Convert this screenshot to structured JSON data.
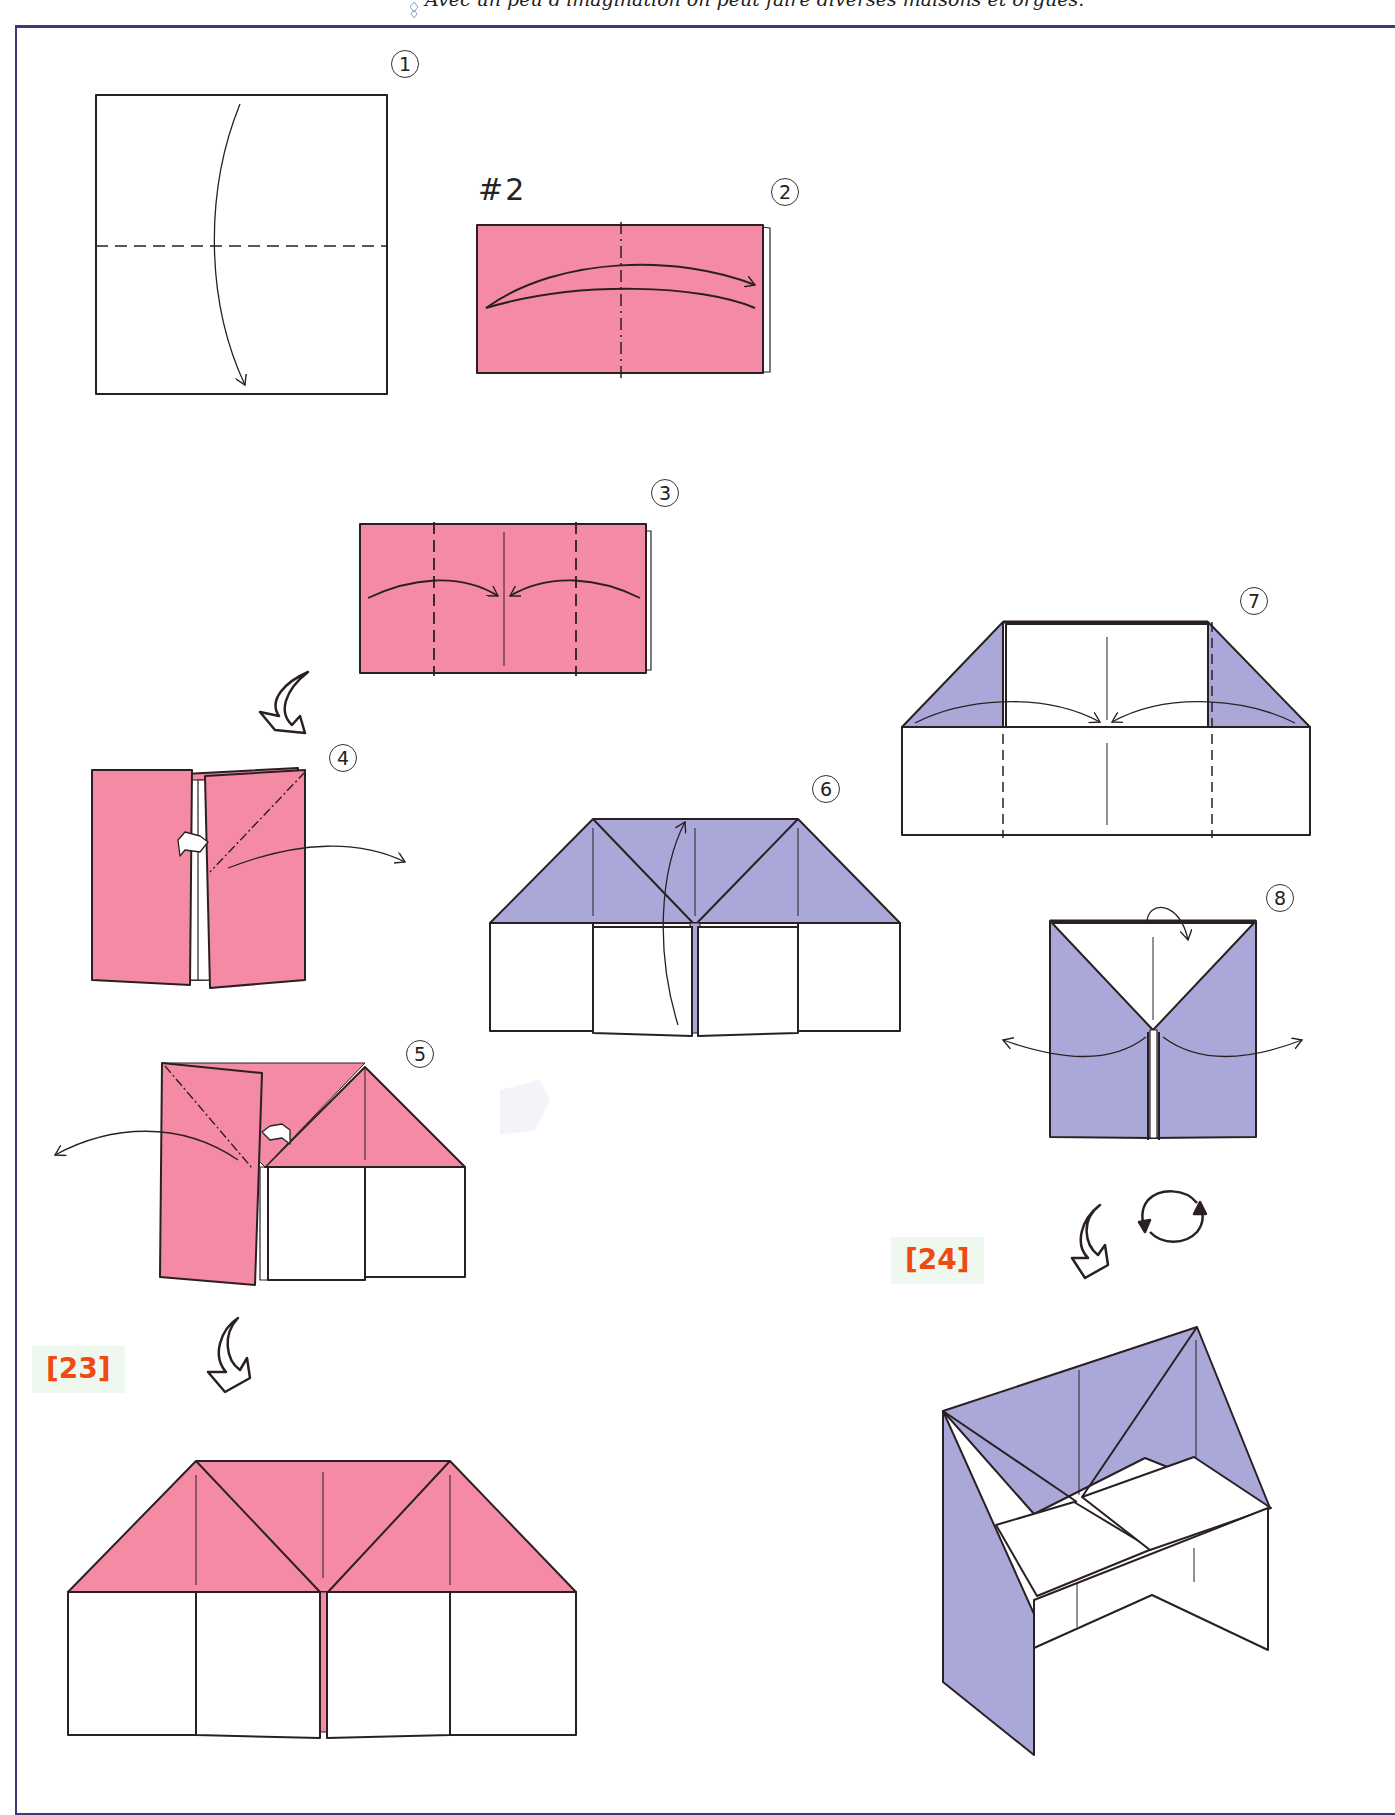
{
  "header": {
    "caption": "Avec un peu d'imagination on peut faire diverses maisons et orgues."
  },
  "colors": {
    "pink": "#f48aa4",
    "lavender": "#aaa8d8",
    "line": "#2a2024",
    "frame": "#3a3a7a",
    "badge_text": "#f04a12",
    "badge_bg": "#eef8ee"
  },
  "model_label": "#2",
  "steps": [
    {
      "number": "1",
      "description": "Square folded in half downward (valley fold)"
    },
    {
      "number": "2",
      "description": "Pink rectangle, fold in half left to right"
    },
    {
      "number": "3",
      "description": "Fold both edges to center line"
    },
    {
      "number": "4",
      "description": "Open and squash right flap"
    },
    {
      "number": "5",
      "description": "Open and squash left flap"
    },
    {
      "number": "6",
      "description": "Fold center flap up"
    },
    {
      "number": "7",
      "description": "Fold corners to center"
    },
    {
      "number": "8",
      "description": "Fold top down, open sides"
    }
  ],
  "results": [
    {
      "label": "[23]",
      "description": "Finished pink house"
    },
    {
      "label": "[24]",
      "description": "Finished lavender organ"
    }
  ]
}
